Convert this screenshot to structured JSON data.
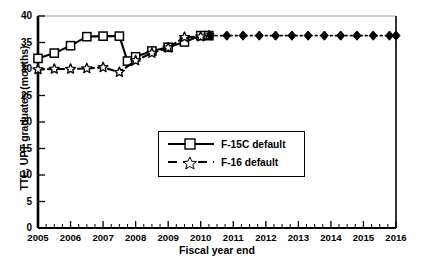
{
  "chart_data": {
    "type": "line",
    "title": "",
    "xlabel": "Fiscal year end",
    "ylabel": "TTE, UPT graduates (months)",
    "xlim": [
      2005,
      2016
    ],
    "ylim": [
      0,
      40
    ],
    "ytick_labels": [
      "0",
      "5",
      "10",
      "15",
      "20",
      "25",
      "30",
      "35",
      "40"
    ],
    "ytick_values": [
      0,
      5,
      10,
      15,
      20,
      25,
      30,
      35,
      40
    ],
    "xtick_labels": [
      "2005",
      "2006",
      "2007",
      "2008",
      "2009",
      "2010",
      "2011",
      "2012",
      "2013",
      "2014",
      "2015",
      "2016"
    ],
    "xtick_values": [
      2005,
      2006,
      2007,
      2008,
      2009,
      2010,
      2011,
      2012,
      2013,
      2014,
      2015,
      2016
    ],
    "minor_ticks_per_interval": 4,
    "grid": false,
    "legend_position": "center",
    "series": [
      {
        "name": "F-15C default",
        "marker": "open-square",
        "linestyle": "solid",
        "color": "#000000",
        "x": [
          2005.0,
          2005.5,
          2006.0,
          2006.5,
          2007.0,
          2007.5,
          2007.75,
          2008.0,
          2008.5,
          2009.0,
          2009.5,
          2010.0,
          2010.25
        ],
        "y": [
          32.0,
          33.0,
          34.4,
          36.1,
          36.2,
          36.2,
          31.5,
          32.3,
          33.4,
          34.1,
          35.1,
          36.3,
          36.3
        ]
      },
      {
        "name": "F-16 default",
        "marker": "open-star",
        "linestyle": "dashed",
        "color": "#000000",
        "x": [
          2005.0,
          2005.5,
          2006.0,
          2006.5,
          2007.0,
          2007.5,
          2008.0,
          2008.5,
          2009.0,
          2009.5,
          2010.0,
          2010.25
        ],
        "y": [
          29.9,
          30.0,
          30.0,
          30.1,
          30.3,
          29.4,
          31.6,
          33.0,
          34.0,
          36.0,
          36.1,
          36.3
        ]
      },
      {
        "name": "projection",
        "marker": "filled-diamond",
        "linestyle": "dotted",
        "color": "#000000",
        "x": [
          2010.3,
          2010.8,
          2011.3,
          2011.8,
          2012.3,
          2012.8,
          2013.3,
          2013.8,
          2014.3,
          2014.8,
          2015.3,
          2015.8,
          2016.0
        ],
        "y": [
          36.3,
          36.3,
          36.3,
          36.3,
          36.3,
          36.3,
          36.3,
          36.3,
          36.3,
          36.3,
          36.3,
          36.3,
          36.3
        ]
      }
    ],
    "legend_entries": [
      {
        "label": "F-15C default",
        "marker": "open-square",
        "linestyle": "solid"
      },
      {
        "label": "F-16 default",
        "marker": "open-star",
        "linestyle": "dashed"
      }
    ]
  }
}
